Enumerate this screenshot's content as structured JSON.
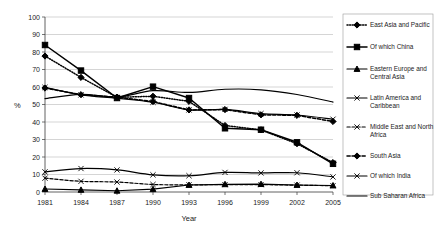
{
  "chart_data": {
    "type": "line",
    "title": "",
    "xlabel": "Year",
    "ylabel": "%",
    "x": [
      1981,
      1984,
      1987,
      1990,
      1993,
      1996,
      1999,
      2002,
      2005
    ],
    "categories": [
      "1981",
      "1984",
      "1987",
      "1990",
      "1993",
      "1996",
      "1999",
      "2002",
      "2005"
    ],
    "ylim": [
      0,
      100
    ],
    "yticks": [
      0,
      10,
      20,
      30,
      40,
      50,
      60,
      70,
      80,
      90,
      100
    ],
    "grid": true,
    "legend_position": "right",
    "series": [
      {
        "name": "East Asia and Pacific",
        "values": [
          77.7,
          65.5,
          54.1,
          54.7,
          51.8,
          38.0,
          35.5,
          27.6,
          16.8
        ],
        "style": "dotted",
        "marker": "diamond"
      },
      {
        "name": "Of which China",
        "values": [
          84.0,
          69.4,
          53.7,
          60.2,
          53.7,
          36.4,
          35.6,
          28.4,
          16.1
        ],
        "style": "solid",
        "marker": "square"
      },
      {
        "name": "Eastern Europe and Central Asia",
        "values": [
          1.7,
          1.2,
          0.7,
          1.6,
          4.0,
          4.4,
          4.5,
          4.0,
          3.7
        ],
        "style": "solid",
        "marker": "triangle"
      },
      {
        "name": "Latin America and Caribbean",
        "values": [
          11.5,
          13.4,
          12.6,
          9.8,
          9.3,
          11.2,
          10.9,
          11.0,
          8.6
        ],
        "style": "solid",
        "marker": "x"
      },
      {
        "name": "Middle East and North Africa",
        "values": [
          7.9,
          6.1,
          5.7,
          4.3,
          4.1,
          4.2,
          4.2,
          3.9,
          3.6
        ],
        "style": "dashed",
        "marker": "x"
      },
      {
        "name": "South Asia",
        "values": [
          59.4,
          55.6,
          54.2,
          51.7,
          46.9,
          47.1,
          44.1,
          43.8,
          40.3
        ],
        "style": "dashed",
        "marker": "diamond"
      },
      {
        "name": "Of which India",
        "values": [
          59.8,
          55.5,
          53.6,
          51.3,
          46.9,
          47.2,
          44.8,
          44.0,
          41.6
        ],
        "style": "solid",
        "marker": "x"
      },
      {
        "name": "Sub Saharan Africa",
        "values": [
          53.4,
          55.8,
          54.3,
          57.9,
          56.9,
          58.7,
          58.4,
          55.7,
          51.4
        ],
        "style": "solid",
        "marker": "none"
      }
    ]
  },
  "legend": {
    "items": [
      {
        "label": "East Asia and Pacific"
      },
      {
        "label": "Of which China"
      },
      {
        "label": "Eastern Europe and Central Asia"
      },
      {
        "label": "Latin America and Caribbean"
      },
      {
        "label": "Middle East and North Africa"
      },
      {
        "label": "South Asia"
      },
      {
        "label": "Of which India"
      },
      {
        "label": "Sub Saharan Africa"
      }
    ]
  }
}
